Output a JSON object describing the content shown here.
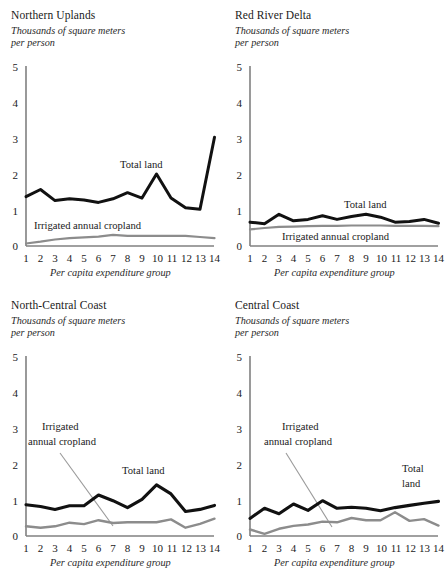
{
  "figure": {
    "subtitle_line1": "Thousands of square meters",
    "subtitle_line2": "per person",
    "xlabel": "Per capita expenditure group",
    "series_label_total": "Total land",
    "series_label_irrigated": "Irrigated annual cropland",
    "series_label_irrigated_l1": "Irrigated",
    "series_label_irrigated_l2": "annual cropland",
    "series_label_total_l1": "Total",
    "series_label_total_l2": "land",
    "color_total": "#111111",
    "color_irrigated": "#8c8c8c",
    "color_axis": "#808080"
  },
  "chart_data": [
    {
      "type": "line",
      "title": "Northern Uplands",
      "xlabel": "Per capita expenditure group",
      "ylabel": "Thousands of square meters per person",
      "categories": [
        1,
        2,
        3,
        4,
        5,
        6,
        7,
        8,
        9,
        10,
        11,
        12,
        13,
        14
      ],
      "ylim": [
        0,
        5
      ],
      "yticks": [
        0,
        1,
        2,
        3,
        4,
        5
      ],
      "grid": false,
      "legend": "inline-annotation",
      "series": [
        {
          "name": "Total land",
          "values": [
            1.37,
            1.57,
            1.26,
            1.31,
            1.28,
            1.21,
            1.31,
            1.48,
            1.33,
            2.0,
            1.33,
            1.06,
            1.02,
            3.02
          ]
        },
        {
          "name": "Irrigated annual cropland",
          "values": [
            0.07,
            0.12,
            0.18,
            0.22,
            0.24,
            0.26,
            0.31,
            0.28,
            0.28,
            0.28,
            0.28,
            0.28,
            0.25,
            0.22
          ]
        }
      ]
    },
    {
      "type": "line",
      "title": "Red River Delta",
      "xlabel": "Per capita expenditure group",
      "ylabel": "Thousands of square meters per person",
      "categories": [
        1,
        2,
        3,
        4,
        5,
        6,
        7,
        8,
        9,
        10,
        11,
        12,
        13,
        14
      ],
      "ylim": [
        0,
        5
      ],
      "yticks": [
        0,
        1,
        2,
        3,
        4,
        5
      ],
      "grid": false,
      "legend": "inline-annotation",
      "series": [
        {
          "name": "Total land",
          "values": [
            0.66,
            0.62,
            0.88,
            0.7,
            0.74,
            0.84,
            0.74,
            0.82,
            0.88,
            0.8,
            0.66,
            0.68,
            0.74,
            0.63
          ]
        },
        {
          "name": "Irrigated annual cropland",
          "values": [
            0.46,
            0.5,
            0.53,
            0.54,
            0.55,
            0.56,
            0.56,
            0.57,
            0.57,
            0.57,
            0.56,
            0.56,
            0.56,
            0.55
          ]
        }
      ]
    },
    {
      "type": "line",
      "title": "North-Central Coast",
      "xlabel": "Per capita expenditure group",
      "ylabel": "Thousands of square meters per person",
      "categories": [
        1,
        2,
        3,
        4,
        5,
        6,
        7,
        8,
        9,
        10,
        11,
        12,
        13,
        14
      ],
      "ylim": [
        0,
        5
      ],
      "yticks": [
        0,
        1,
        2,
        3,
        4,
        5
      ],
      "grid": false,
      "legend": "leader-line",
      "series": [
        {
          "name": "Total land",
          "values": [
            0.87,
            0.82,
            0.74,
            0.84,
            0.84,
            1.14,
            0.98,
            0.79,
            1.02,
            1.42,
            1.17,
            0.68,
            0.74,
            0.85
          ]
        },
        {
          "name": "Irrigated annual cropland",
          "values": [
            0.27,
            0.23,
            0.27,
            0.37,
            0.33,
            0.44,
            0.36,
            0.38,
            0.38,
            0.38,
            0.46,
            0.23,
            0.34,
            0.48
          ]
        }
      ]
    },
    {
      "type": "line",
      "title": "Central Coast",
      "xlabel": "Per capita expenditure group",
      "ylabel": "Thousands of square meters per person",
      "categories": [
        1,
        2,
        3,
        4,
        5,
        6,
        7,
        8,
        9,
        10,
        11,
        12,
        13,
        14
      ],
      "ylim": [
        0,
        5
      ],
      "yticks": [
        0,
        1,
        2,
        3,
        4,
        5
      ],
      "grid": false,
      "legend": "leader-line",
      "series": [
        {
          "name": "Total land",
          "values": [
            0.49,
            0.77,
            0.62,
            0.89,
            0.71,
            0.98,
            0.77,
            0.8,
            0.77,
            0.7,
            0.79,
            0.85,
            0.91,
            0.96
          ]
        },
        {
          "name": "Irrigated annual cropland",
          "values": [
            0.18,
            0.06,
            0.2,
            0.28,
            0.32,
            0.4,
            0.38,
            0.5,
            0.44,
            0.44,
            0.66,
            0.42,
            0.47,
            0.29
          ]
        }
      ]
    }
  ]
}
